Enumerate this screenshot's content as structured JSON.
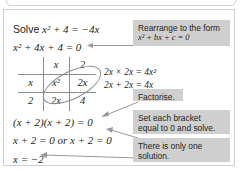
{
  "worksheet": {
    "lines": {
      "solve_label": "Solve",
      "solve_expr": "x² + 4 = −4x",
      "standard_form": "x² + 4x + 4 = 0",
      "factorised": "(x + 2)(x + 2) = 0",
      "brackets": "x + 2 = 0 or x + 2 = 0",
      "answer": "x = −2"
    },
    "working": {
      "product": "2x × 2x = 4x²",
      "sum": "2x + 2x = 4x"
    },
    "grid": {
      "col_headers": [
        "x",
        "2"
      ],
      "row_headers": [
        "x",
        "2"
      ],
      "cells": [
        [
          "x²",
          "2x"
        ],
        [
          "2x",
          "4"
        ]
      ],
      "circled": [
        "2x",
        "2x"
      ]
    },
    "callouts": [
      {
        "id": "rearrange",
        "line1": "Rearrange to the form",
        "line2": "x² + bx + c = 0"
      },
      {
        "id": "factorise",
        "line1": "Factorise.",
        "line2": ""
      },
      {
        "id": "set-bracket",
        "line1": "Set each bracket",
        "line2": "equal to 0 and solve."
      },
      {
        "id": "one-solution",
        "line1": "There is only one",
        "line2": "solution."
      }
    ]
  },
  "colors": {
    "callout_bg": "#cfcfcf",
    "ink": "#231f20",
    "rule": "#8d8d8d",
    "border": "#cfcfcf"
  }
}
